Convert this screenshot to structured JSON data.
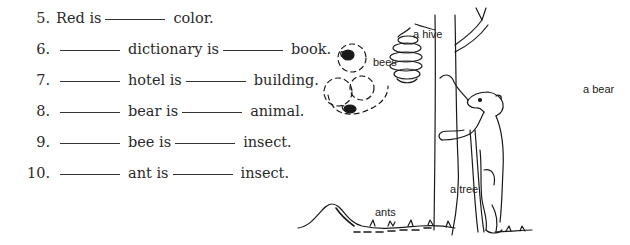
{
  "exercise": {
    "items": [
      {
        "number": "5.",
        "parts": [
          "Red is",
          "",
          "color."
        ]
      },
      {
        "number": "6.",
        "parts": [
          "",
          "dictionary is",
          "",
          "book."
        ]
      },
      {
        "number": "7.",
        "parts": [
          "",
          "hotel is",
          "",
          "building."
        ]
      },
      {
        "number": "8.",
        "parts": [
          "",
          "bear is",
          "",
          "animal."
        ]
      },
      {
        "number": "9.",
        "parts": [
          "",
          "bee is",
          "",
          "insect."
        ]
      },
      {
        "number": "10.",
        "parts": [
          "",
          "ant is",
          "",
          "insect."
        ]
      }
    ]
  },
  "illustration": {
    "labels": {
      "hive": "a hive",
      "bees": "bees",
      "bear": "a bear",
      "tree": "a tree",
      "ants": "ants"
    }
  }
}
